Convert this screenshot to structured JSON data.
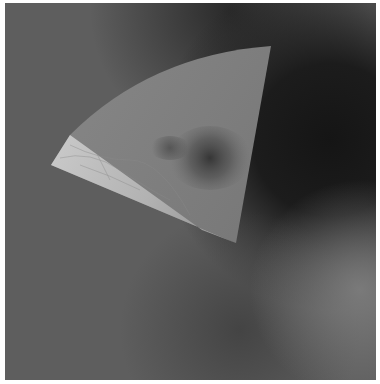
{
  "image": {
    "description": "Grayscale planetary image: a fan-shaped (wedge) high-resolution mosaic overlaid on a darker, cloud-banded global background",
    "colors": {
      "border": "#ffffff",
      "background_mid": "#5e5e5e",
      "background_dark_band": "#1e1e1e",
      "background_light_band": "#6e6e6e",
      "wedge_fill": "#7d7d7d",
      "wedge_bright_strip": "#b9b9b9",
      "dark_feature": "#3a3a3a"
    },
    "wedge": {
      "tip": [
        51,
        165
      ],
      "top_right": [
        271,
        46
      ],
      "bottom": [
        236,
        243
      ],
      "bright_strip_top": [
        70,
        135
      ],
      "bright_strip_end": [
        202,
        230
      ]
    }
  }
}
